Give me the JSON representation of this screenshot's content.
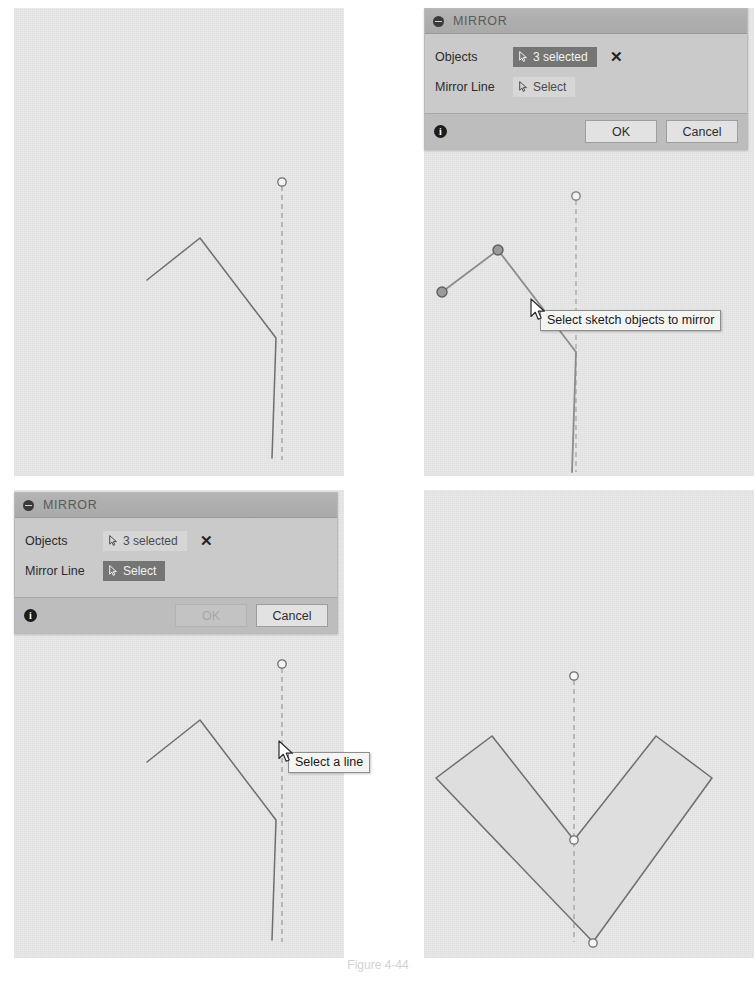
{
  "figure": {
    "caption": "Figure 4-44"
  },
  "panels": [
    {
      "id": "panel-tl",
      "name": "step-1-open-polyline-with-mirror-line",
      "description": "Open polyline sketch and vertical dashed mirror line, nothing selected"
    },
    {
      "id": "panel-tr",
      "name": "step-2-objects-selected",
      "description": "Three sketch objects selected, Objects field active"
    },
    {
      "id": "panel-bl",
      "name": "step-3-pick-mirror-line",
      "description": "Mirror Line field active, waiting for a line pick, OK disabled"
    },
    {
      "id": "panel-br",
      "name": "step-4-mirrored-result",
      "description": "Resulting symmetric V shape after mirroring"
    }
  ],
  "dialogs": {
    "top_right": {
      "title": "MIRROR",
      "collapse_icon": "collapse-minus-icon",
      "rows": [
        {
          "label": "Objects",
          "field_value": "3 selected",
          "field_state": "active",
          "field_icon": "select-cursor-icon",
          "clear_icon": "clear-x-icon",
          "has_clear": true
        },
        {
          "label": "Mirror Line",
          "field_value": "Select",
          "field_state": "idle",
          "field_icon": "select-cursor-icon",
          "has_clear": false
        }
      ],
      "info_icon": "info-icon",
      "info_glyph": "i",
      "ok_label": "OK",
      "ok_state": "enabled",
      "cancel_label": "Cancel"
    },
    "bottom_left": {
      "title": "MIRROR",
      "collapse_icon": "collapse-minus-icon",
      "rows": [
        {
          "label": "Objects",
          "field_value": "3 selected",
          "field_state": "idle",
          "field_icon": "select-cursor-icon",
          "clear_icon": "clear-x-icon",
          "has_clear": true
        },
        {
          "label": "Mirror Line",
          "field_value": "Select",
          "field_state": "active",
          "field_icon": "select-cursor-icon",
          "has_clear": false
        }
      ],
      "info_icon": "info-icon",
      "info_glyph": "i",
      "ok_label": "OK",
      "ok_state": "disabled",
      "cancel_label": "Cancel"
    }
  },
  "tooltips": {
    "top_right": "Select sketch objects to mirror",
    "bottom_left": "Select a line"
  },
  "colors": {
    "canvas": "#eaeaea",
    "dialog_body": "#cacaca",
    "dialog_title": "#b0b0b0",
    "dialog_footer": "#bdbdbd",
    "field_active": "#757575",
    "field_idle": "#d6d6d6",
    "sketch_line": "#6e6e6e",
    "sketch_line_selected": "#8a8a8a",
    "construction_line": "#9a9a9a",
    "shape_fill": "#dcdcdc",
    "point_selected": "#8f8f8f",
    "tooltip_bg": "#f4f4f2"
  },
  "geometry": {
    "top_left": {
      "polyline_points": "137,237 192,192 272,335 267,456",
      "mirror_line": {
        "x": 281,
        "y1": 182,
        "y2": 458
      },
      "mirror_handle": {
        "cx": 281,
        "cy": 182,
        "r": 4
      }
    },
    "top_right": {
      "polyline_points": "440,290 515,250 533,352 576,470",
      "selected_points": [
        {
          "cx": 440,
          "cy": 290
        },
        {
          "cx": 515,
          "cy": 250
        }
      ],
      "mirror_line": {
        "x": 573,
        "y1": 192,
        "y2": 468
      },
      "mirror_handle": {
        "cx": 573,
        "cy": 192,
        "r": 4
      }
    },
    "bottom_left": {
      "polyline_points": "137,724 192,679 272,822 267,943",
      "mirror_line": {
        "x": 281,
        "y1": 669,
        "y2": 945
      },
      "mirror_handle": {
        "cx": 281,
        "cy": 669,
        "r": 4
      }
    },
    "bottom_right": {
      "shape_points": "434,773 490,733 573,838 654,733 710,773 591,940",
      "mirror_line": {
        "x": 573,
        "y1": 677,
        "y2": 940
      },
      "handles": [
        {
          "cx": 573,
          "cy": 677,
          "r": 4
        },
        {
          "cx": 573,
          "cy": 838,
          "r": 4
        },
        {
          "cx": 573,
          "cy": 940,
          "r": 4
        }
      ]
    }
  }
}
